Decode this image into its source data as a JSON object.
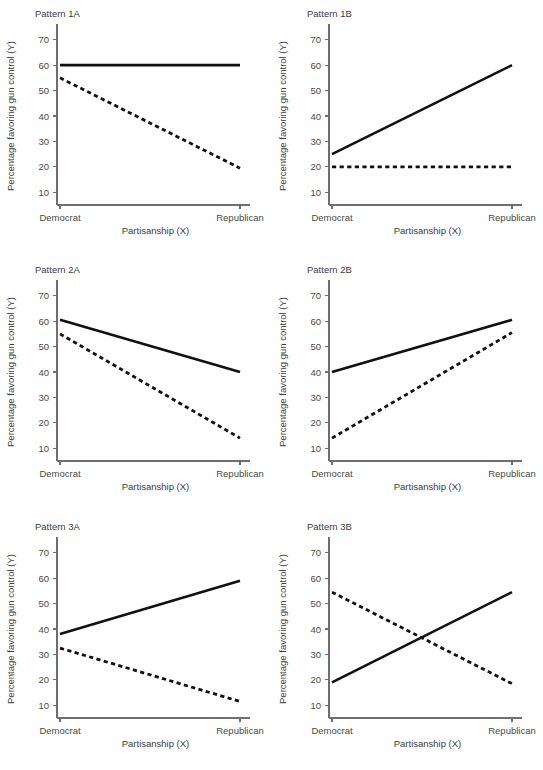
{
  "figure": {
    "width": 543,
    "height": 770,
    "background": "#ffffff",
    "line_color": "#111111",
    "axis_color": "#6e6e6e",
    "text_color": "#4a4a4a"
  },
  "axes_common": {
    "xlabel": "Partisanship (X)",
    "ylabel": "Percentage favoring gun control (Y)",
    "xticklabels": [
      "Democrat",
      "Republican"
    ],
    "yticklabels": [
      "10",
      "20",
      "30",
      "40",
      "50",
      "60",
      "70"
    ],
    "ylim": [
      5,
      75
    ],
    "xlim": [
      0,
      1
    ],
    "grid": false,
    "legend": "none"
  },
  "chart_data": [
    {
      "type": "line",
      "title": "Pattern 1A",
      "xlabel": "Partisanship (X)",
      "ylabel": "Percentage favoring gun control (Y)",
      "categories": [
        "Democrat",
        "Republican"
      ],
      "x": [
        0,
        1
      ],
      "ylim": [
        5,
        75
      ],
      "yticks": [
        10,
        20,
        30,
        40,
        50,
        60,
        70
      ],
      "grid": false,
      "legend": "none",
      "series": [
        {
          "name": "solid",
          "style": "solid",
          "values": [
            60,
            60
          ]
        },
        {
          "name": "dashed",
          "style": "dashed",
          "values": [
            55,
            19.5
          ]
        }
      ]
    },
    {
      "type": "line",
      "title": "Pattern 1B",
      "xlabel": "Partisanship (X)",
      "ylabel": "Percentage favoring gun control (Y)",
      "categories": [
        "Democrat",
        "Republican"
      ],
      "x": [
        0,
        1
      ],
      "ylim": [
        5,
        75
      ],
      "yticks": [
        10,
        20,
        30,
        40,
        50,
        60,
        70
      ],
      "grid": false,
      "legend": "none",
      "series": [
        {
          "name": "solid",
          "style": "solid",
          "values": [
            25,
            60
          ]
        },
        {
          "name": "dashed",
          "style": "dashed",
          "values": [
            20,
            20
          ]
        }
      ]
    },
    {
      "type": "line",
      "title": "Pattern 2A",
      "xlabel": "Partisanship (X)",
      "ylabel": "Percentage favoring gun control (Y)",
      "categories": [
        "Democrat",
        "Republican"
      ],
      "x": [
        0,
        1
      ],
      "ylim": [
        5,
        75
      ],
      "yticks": [
        10,
        20,
        30,
        40,
        50,
        60,
        70
      ],
      "grid": false,
      "legend": "none",
      "series": [
        {
          "name": "solid",
          "style": "solid",
          "values": [
            60.5,
            40
          ]
        },
        {
          "name": "dashed",
          "style": "dashed",
          "values": [
            55,
            14
          ]
        }
      ]
    },
    {
      "type": "line",
      "title": "Pattern 2B",
      "xlabel": "Partisanship (X)",
      "ylabel": "Percentage favoring gun control (Y)",
      "categories": [
        "Democrat",
        "Republican"
      ],
      "x": [
        0,
        1
      ],
      "ylim": [
        5,
        75
      ],
      "yticks": [
        10,
        20,
        30,
        40,
        50,
        60,
        70
      ],
      "grid": false,
      "legend": "none",
      "series": [
        {
          "name": "solid",
          "style": "solid",
          "values": [
            40,
            60.5
          ]
        },
        {
          "name": "dashed",
          "style": "dashed",
          "values": [
            14,
            55.5
          ]
        }
      ]
    },
    {
      "type": "line",
      "title": "Pattern 3A",
      "xlabel": "Partisanship (X)",
      "ylabel": "Percentage favoring gun control (Y)",
      "categories": [
        "Democrat",
        "Republican"
      ],
      "x": [
        0,
        1
      ],
      "ylim": [
        5,
        75
      ],
      "yticks": [
        10,
        20,
        30,
        40,
        50,
        60,
        70
      ],
      "grid": false,
      "legend": "none",
      "series": [
        {
          "name": "solid",
          "style": "solid",
          "values": [
            38,
            59
          ]
        },
        {
          "name": "dashed",
          "style": "dashed",
          "values": [
            32.5,
            11.5
          ]
        }
      ]
    },
    {
      "type": "line",
      "title": "Pattern 3B",
      "xlabel": "Partisanship (X)",
      "ylabel": "Percentage favoring gun control (Y)",
      "categories": [
        "Democrat",
        "Republican"
      ],
      "x": [
        0,
        1
      ],
      "ylim": [
        5,
        75
      ],
      "yticks": [
        10,
        20,
        30,
        40,
        50,
        60,
        70
      ],
      "grid": false,
      "legend": "none",
      "series": [
        {
          "name": "solid",
          "style": "solid",
          "values": [
            19,
            54.5
          ]
        },
        {
          "name": "dashed",
          "style": "dashed",
          "values": [
            54.5,
            18.5
          ]
        }
      ]
    }
  ]
}
